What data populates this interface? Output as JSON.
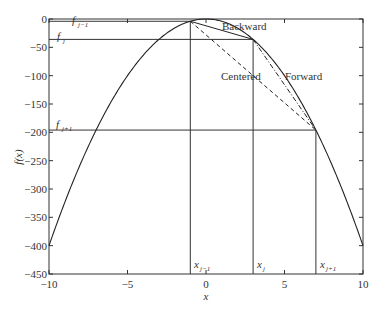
{
  "chart_data": {
    "type": "line",
    "title": "",
    "xlabel": "x",
    "ylabel": "f(x)",
    "xlim": [
      -10,
      10
    ],
    "ylim": [
      -450,
      0
    ],
    "xticks": [
      -10,
      -5,
      0,
      5,
      10
    ],
    "xtick_labels": [
      "−10",
      "−5",
      "0",
      "5",
      "10"
    ],
    "yticks": [
      0,
      -50,
      -100,
      -150,
      -200,
      -250,
      -300,
      -350,
      -400,
      -450
    ],
    "ytick_labels": [
      "0",
      "−50",
      "−100",
      "−150",
      "−200",
      "−250",
      "−300",
      "−350",
      "−400",
      "−450"
    ],
    "grid": false,
    "legend": null,
    "curve": {
      "name": "f(x)",
      "function": "-4x^2",
      "x": [
        -10,
        -8,
        -6,
        -4,
        -2,
        -1,
        0,
        1,
        2,
        3,
        4,
        6,
        7,
        8,
        10
      ],
      "y": [
        -400,
        -256,
        -144,
        -64,
        -16,
        -4,
        0,
        -4,
        -16,
        -36,
        -64,
        -144,
        -196,
        -256,
        -400
      ]
    },
    "points": [
      {
        "label": "x_{j-1}",
        "x": -1,
        "f_label": "f_{j-1}",
        "f": -4
      },
      {
        "label": "x_j",
        "x": 3,
        "f_label": "f_j",
        "f": -36
      },
      {
        "label": "x_{j+1}",
        "x": 7,
        "f_label": "f_{j+1}",
        "f": -196
      }
    ],
    "secants": [
      {
        "name": "Backward",
        "from_x": -1,
        "to_x": 3,
        "style": "solid"
      },
      {
        "name": "Centered",
        "from_x": -1,
        "to_x": 7,
        "style": "dashed"
      },
      {
        "name": "Forward",
        "from_x": 3,
        "to_x": 7,
        "style": "dash-dot"
      }
    ],
    "annotations": [
      "Backward",
      "Centered",
      "Forward"
    ]
  },
  "labels": {
    "xlabel": "x",
    "ylabel": "f(x)",
    "backward": "Backward",
    "centered": "Centered",
    "forward": "Forward",
    "f_base": "f",
    "x_base": "x",
    "sub_jm1": "j−1",
    "sub_j": "j",
    "sub_jp1": "j+1"
  },
  "colors": {
    "axis": "#333333",
    "curve": "#222222",
    "background": "#ffffff"
  }
}
